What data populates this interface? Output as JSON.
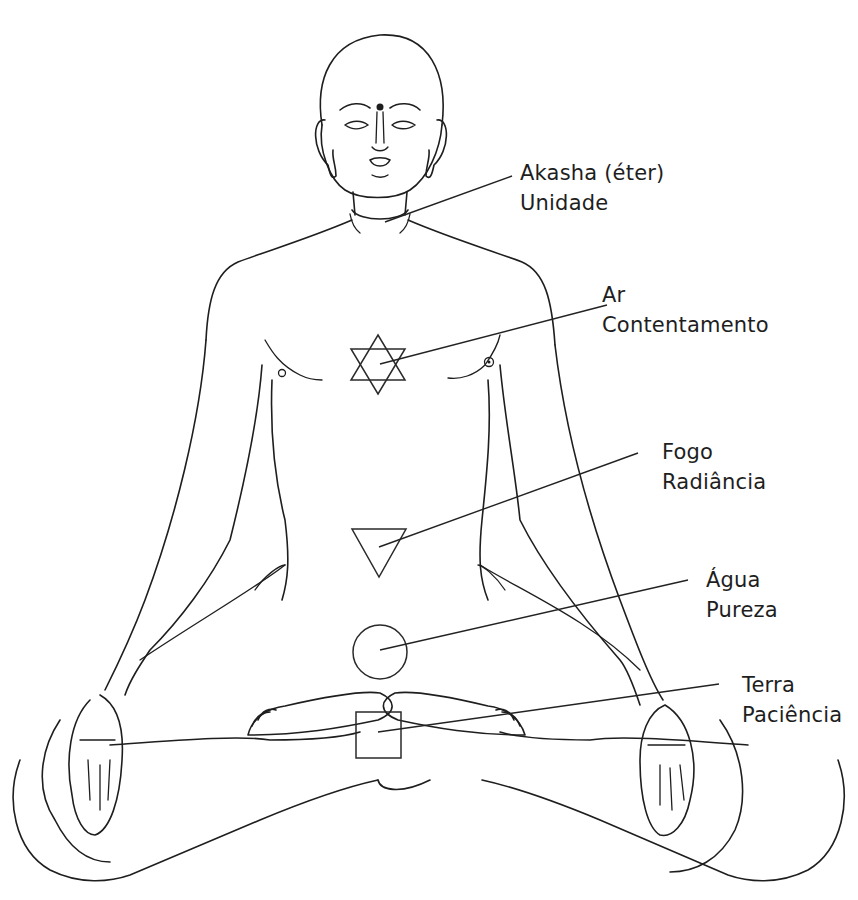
{
  "figure": {
    "line_color": "#1e1e1e",
    "background": "#ffffff"
  },
  "labels": [
    {
      "id": "akasha",
      "element": "Akasha (éter)",
      "quality": "Unidade",
      "symbol": "throat-point-icon"
    },
    {
      "id": "ar",
      "element": "Ar",
      "quality": "Contentamento",
      "symbol": "hexagram-icon"
    },
    {
      "id": "fogo",
      "element": "Fogo",
      "quality": "Radiância",
      "symbol": "downward-triangle-icon"
    },
    {
      "id": "agua",
      "element": "Água",
      "quality": "Pureza",
      "symbol": "circle-icon"
    },
    {
      "id": "terra",
      "element": "Terra",
      "quality": "Paciência",
      "symbol": "square-icon"
    }
  ]
}
